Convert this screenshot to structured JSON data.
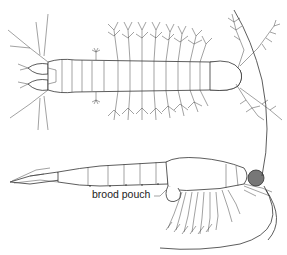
{
  "figure": {
    "views": [
      {
        "name": "dorsal-view",
        "description": "dorsal view of crustacean larva with feathery setae"
      },
      {
        "name": "lateral-view",
        "description": "lateral view of mysid with brood pouch"
      }
    ],
    "annotations": [
      {
        "id": "brood_pouch",
        "label": "brood pouch"
      }
    ],
    "colors": {
      "line": "#333333",
      "background": "#ffffff",
      "eye": "#777777"
    }
  }
}
